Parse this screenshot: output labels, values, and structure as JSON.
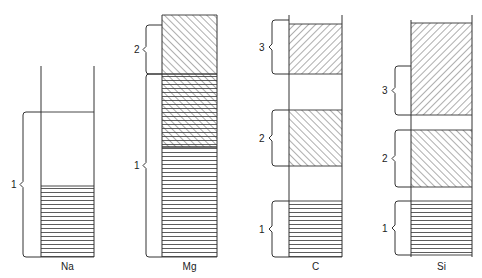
{
  "diagram": {
    "type": "electron-shell-occupancy",
    "stroke_color": "#333333",
    "background": "#ffffff",
    "columns": [
      {
        "label": "Na",
        "x_left": 41,
        "x_right": 94,
        "line_top_left": 66,
        "line_top_right": 66,
        "bottom": 257,
        "top_cap": false,
        "bands": [
          {
            "y0": 186,
            "y1": 257,
            "pattern": "horizontal"
          }
        ],
        "divider_lines": [
          112
        ],
        "brackets": [
          {
            "label": "1",
            "y0": 112,
            "y1": 257,
            "x": 23,
            "label_x": 11
          }
        ]
      },
      {
        "label": "Mg",
        "x_left": 162,
        "x_right": 217,
        "line_top_left": 15,
        "line_top_right": 15,
        "bottom": 257,
        "top_cap": false,
        "bands": [
          {
            "y0": 15,
            "y1": 74,
            "pattern": "diagonal-up"
          },
          {
            "y0": 74,
            "y1": 147,
            "pattern": "crosshatch"
          },
          {
            "y0": 147,
            "y1": 257,
            "pattern": "horizontal"
          }
        ],
        "divider_lines": [],
        "brackets": [
          {
            "label": "2",
            "y0": 25,
            "y1": 74,
            "x": 146,
            "label_x": 134
          },
          {
            "label": "1",
            "y0": 74,
            "y1": 257,
            "x": 146,
            "label_x": 134
          }
        ]
      },
      {
        "label": "C",
        "x_left": 289,
        "x_right": 342,
        "line_top_left": 15,
        "line_top_right": 15,
        "bottom": 257,
        "top_cap": false,
        "bands": [
          {
            "y0": 24,
            "y1": 74,
            "pattern": "diagonal-down"
          },
          {
            "y0": 110,
            "y1": 166,
            "pattern": "diagonal-up"
          },
          {
            "y0": 201,
            "y1": 257,
            "pattern": "horizontal"
          }
        ],
        "divider_lines": [],
        "brackets": [
          {
            "label": "3",
            "y0": 20,
            "y1": 74,
            "x": 272,
            "label_x": 259
          },
          {
            "label": "2",
            "y0": 110,
            "y1": 166,
            "x": 272,
            "label_x": 259
          },
          {
            "label": "1",
            "y0": 201,
            "y1": 257,
            "x": 272,
            "label_x": 259
          }
        ]
      },
      {
        "label": "Si",
        "x_left": 411,
        "x_right": 472,
        "line_top_left": 20,
        "line_top_right": 15,
        "bottom": 257,
        "top_cap": false,
        "bands": [
          {
            "y0": 23,
            "y1": 115,
            "pattern": "diagonal-down"
          },
          {
            "y0": 130,
            "y1": 187,
            "pattern": "diagonal-up"
          },
          {
            "y0": 201,
            "y1": 255,
            "pattern": "horizontal"
          }
        ],
        "divider_lines": [],
        "brackets": [
          {
            "label": "3",
            "y0": 66,
            "y1": 115,
            "x": 395,
            "label_x": 382
          },
          {
            "label": "2",
            "y0": 130,
            "y1": 187,
            "x": 395,
            "label_x": 382
          },
          {
            "label": "1",
            "y0": 201,
            "y1": 255,
            "x": 395,
            "label_x": 382
          }
        ]
      }
    ],
    "column_label_y": 270
  }
}
